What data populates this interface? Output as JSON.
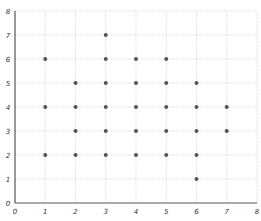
{
  "chart_data": {
    "type": "scatter",
    "title": "",
    "xlabel": "",
    "ylabel": "",
    "xlim": [
      0,
      8
    ],
    "ylim": [
      0,
      8
    ],
    "grid": true,
    "legend": null,
    "x_ticks": [
      "0",
      "1",
      "2",
      "3",
      "4",
      "5",
      "6",
      "7",
      "8"
    ],
    "y_ticks": [
      "0",
      "1",
      "2",
      "3",
      "4",
      "5",
      "6",
      "7",
      "8"
    ],
    "point_color": "#555555",
    "points": [
      {
        "x": 1,
        "y": 6
      },
      {
        "x": 1,
        "y": 4
      },
      {
        "x": 1,
        "y": 2
      },
      {
        "x": 2,
        "y": 5
      },
      {
        "x": 2,
        "y": 4
      },
      {
        "x": 2,
        "y": 3
      },
      {
        "x": 2,
        "y": 2
      },
      {
        "x": 3,
        "y": 7
      },
      {
        "x": 3,
        "y": 6
      },
      {
        "x": 3,
        "y": 5
      },
      {
        "x": 3,
        "y": 4
      },
      {
        "x": 3,
        "y": 3
      },
      {
        "x": 3,
        "y": 2
      },
      {
        "x": 4,
        "y": 6
      },
      {
        "x": 4,
        "y": 5
      },
      {
        "x": 4,
        "y": 4
      },
      {
        "x": 4,
        "y": 3
      },
      {
        "x": 4,
        "y": 2
      },
      {
        "x": 5,
        "y": 6
      },
      {
        "x": 5,
        "y": 5
      },
      {
        "x": 5,
        "y": 4
      },
      {
        "x": 5,
        "y": 3
      },
      {
        "x": 5,
        "y": 2
      },
      {
        "x": 6,
        "y": 5
      },
      {
        "x": 6,
        "y": 4
      },
      {
        "x": 6,
        "y": 3
      },
      {
        "x": 6,
        "y": 2
      },
      {
        "x": 6,
        "y": 1
      },
      {
        "x": 7,
        "y": 4
      },
      {
        "x": 7,
        "y": 3
      }
    ]
  }
}
